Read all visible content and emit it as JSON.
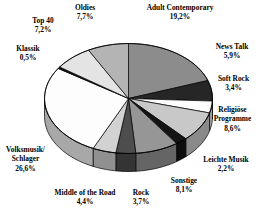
{
  "chart_data": {
    "type": "pie",
    "title": "",
    "subtitle": "",
    "xlabel": "",
    "ylabel": "",
    "legend_position": "none",
    "grid": false,
    "value_suffix": "%",
    "decimal_separator": ",",
    "start_angle_deg": 0,
    "direction": "clockwise",
    "three_d": true,
    "categories": [
      "Adult Contemporary",
      "News Talk",
      "Soft Rock",
      "Religiöse Programme",
      "Leichte Musik",
      "Sonstige",
      "Rock",
      "Middle of the Road",
      "Volksmusik/ Schlager",
      "Klassik",
      "Top 40",
      "Oldies"
    ],
    "values": [
      19.2,
      5.9,
      3.4,
      8.6,
      2.2,
      8.1,
      3.7,
      4.4,
      26.6,
      0.5,
      7.2,
      7.7
    ],
    "value_labels": [
      "19,2%",
      "5,9%",
      "3,4%",
      "8,6%",
      "2,2%",
      "8,1%",
      "3,7%",
      "4,4%",
      "26,6%",
      "0,5%",
      "7,2%",
      "7,7%"
    ],
    "colors": [
      "#8c8c8c",
      "#262626",
      "#fdfdfd",
      "#c8c8c8",
      "#141414",
      "#969696",
      "#4d4d4d",
      "#d2d2d2",
      "#fdfdfd",
      "#141414",
      "#e4e4e4",
      "#b4b4b4"
    ],
    "side_colors": [
      "#5e5e5e",
      "#1a1a1a",
      "#a8a8a8",
      "#8a8a8a",
      "#0d0d0d",
      "#656565",
      "#343434",
      "#909090",
      "#a8a8a8",
      "#0d0d0d",
      "#9c9c9c",
      "#7b7b7b"
    ]
  },
  "slices": [
    {
      "name": "Adult Contemporary",
      "value_label": "19,2%",
      "label_line1": "Adult Contemporary",
      "label_line2": ""
    },
    {
      "name": "News Talk",
      "value_label": "5,9%",
      "label_line1": "News Talk",
      "label_line2": ""
    },
    {
      "name": "Soft Rock",
      "value_label": "3,4%",
      "label_line1": "Soft Rock",
      "label_line2": ""
    },
    {
      "name": "Religiöse Programme",
      "value_label": "8,6%",
      "label_line1": "Religiöse",
      "label_line2": "Programme"
    },
    {
      "name": "Leichte Musik",
      "value_label": "2,2%",
      "label_line1": "Leichte Musik",
      "label_line2": ""
    },
    {
      "name": "Sonstige",
      "value_label": "8,1%",
      "label_line1": "Sonstige",
      "label_line2": ""
    },
    {
      "name": "Rock",
      "value_label": "3,7%",
      "label_line1": "Rock",
      "label_line2": ""
    },
    {
      "name": "Middle of the Road",
      "value_label": "4,4%",
      "label_line1": "Middle of the Road",
      "label_line2": ""
    },
    {
      "name": "Volksmusik/ Schlager",
      "value_label": "26,6%",
      "label_line1": "Volksmusik/",
      "label_line2": "Schlager"
    },
    {
      "name": "Klassik",
      "value_label": "0,5%",
      "label_line1": "Klassik",
      "label_line2": ""
    },
    {
      "name": "Top 40",
      "value_label": "7,2%",
      "label_line1": "Top 40",
      "label_line2": ""
    },
    {
      "name": "Oldies",
      "value_label": "7,7%",
      "label_line1": "Oldies",
      "label_line2": ""
    }
  ]
}
